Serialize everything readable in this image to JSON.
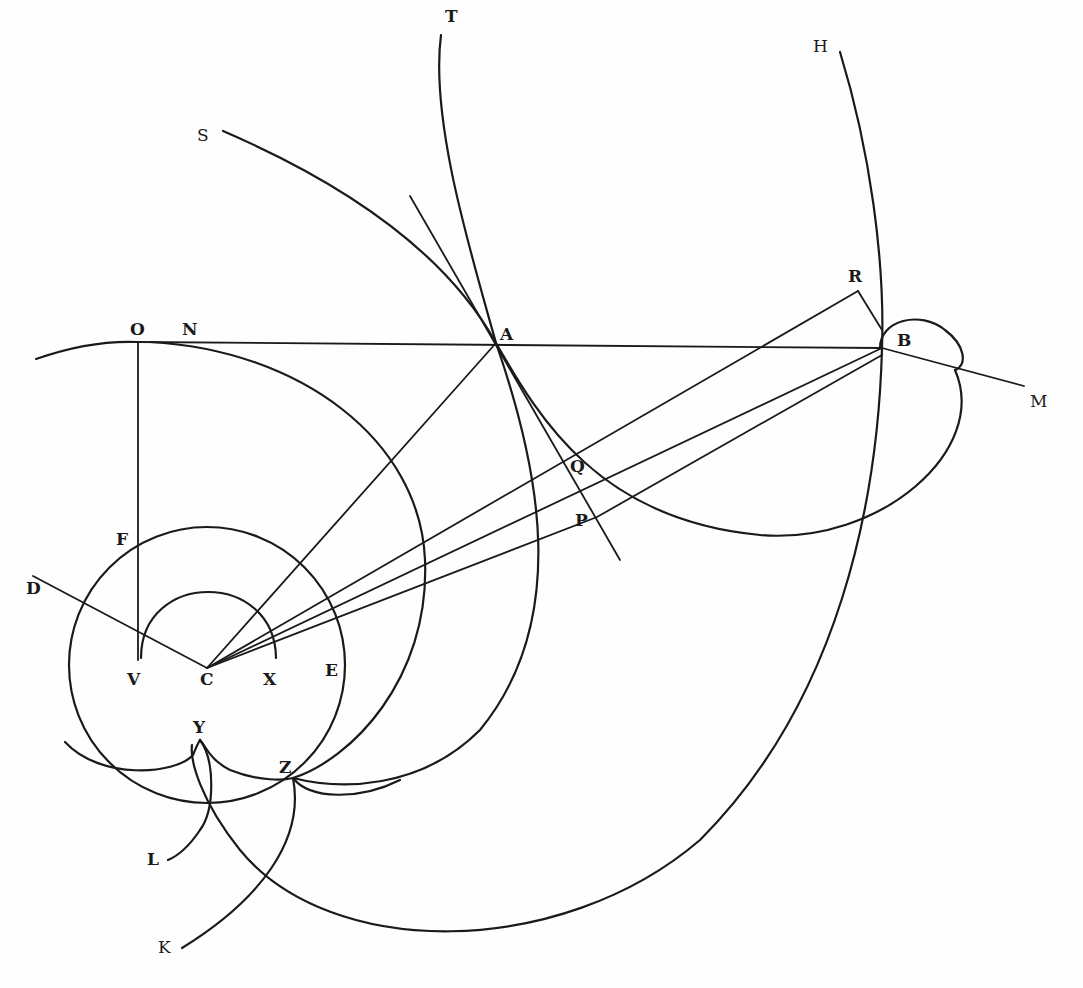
{
  "figure": {
    "stroke_color": "#1a1a1a",
    "background": "#fefefe"
  },
  "labels": {
    "T": "T",
    "H": "H",
    "S": "S",
    "R": "R",
    "O": "O",
    "N": "N",
    "A": "A",
    "B": "B",
    "M": "M",
    "Q": "Q",
    "P": "P",
    "F": "F",
    "D": "D",
    "V": "V",
    "C": "C",
    "X": "X",
    "E": "E",
    "Y": "Y",
    "Z": "Z",
    "L": "L",
    "K": "K"
  },
  "points": {
    "C": [
      207,
      668
    ],
    "V": [
      138,
      660
    ],
    "X": [
      275,
      660
    ],
    "O": [
      138,
      342
    ],
    "A": [
      496,
      343
    ],
    "B": [
      882,
      348
    ],
    "R": [
      858,
      291
    ],
    "M": [
      1024,
      386
    ],
    "P": [
      597,
      517
    ],
    "Q": [
      570,
      465
    ],
    "Z": [
      293,
      778
    ],
    "Y": [
      200,
      745
    ],
    "D": [
      33,
      576
    ]
  }
}
